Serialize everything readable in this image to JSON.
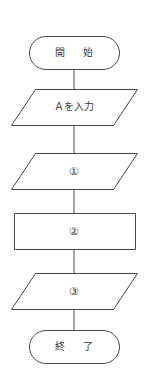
{
  "diagram": {
    "orientation": "vertical",
    "background_color": "#ffffff",
    "stroke_color": "#4a4a4a",
    "text_color": "#3a3a3a",
    "nodes": [
      {
        "id": "start",
        "shape": "terminator",
        "label": "開　始",
        "name": "start-terminator"
      },
      {
        "id": "input-a",
        "shape": "parallelogram",
        "label": "Ａを入力",
        "name": "input-a-parallelogram"
      },
      {
        "id": "step-1",
        "shape": "parallelogram",
        "label": "①",
        "name": "step-1-parallelogram"
      },
      {
        "id": "step-2",
        "shape": "rectangle",
        "label": "②",
        "name": "step-2-process"
      },
      {
        "id": "step-3",
        "shape": "parallelogram",
        "label": "③",
        "name": "step-3-parallelogram"
      },
      {
        "id": "end",
        "shape": "terminator",
        "label": "終　了",
        "name": "end-terminator"
      }
    ],
    "connectors": [
      {
        "from": "start",
        "to": "input-a",
        "arrowhead": "none"
      },
      {
        "from": "input-a",
        "to": "step-1",
        "arrowhead": "none"
      },
      {
        "from": "step-1",
        "to": "step-2",
        "arrowhead": "none"
      },
      {
        "from": "step-2",
        "to": "step-3",
        "arrowhead": "none"
      },
      {
        "from": "step-3",
        "to": "end",
        "arrowhead": "none"
      }
    ]
  }
}
